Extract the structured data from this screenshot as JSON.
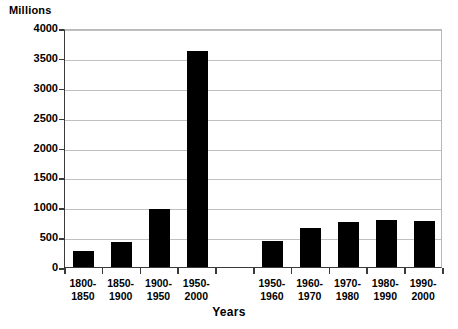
{
  "chart_data": {
    "type": "bar",
    "title": "",
    "ylabel": "Millions",
    "xlabel": "Years",
    "ylim": [
      0,
      4000
    ],
    "ytick_values": [
      0,
      500,
      1000,
      1500,
      2000,
      2500,
      3000,
      3500,
      4000
    ],
    "ytick_labels": [
      "0",
      "500",
      "1000",
      "1500",
      "2000",
      "2500",
      "3000",
      "3500",
      "4000"
    ],
    "grid": true,
    "legend": "none",
    "bar_color": "#000000",
    "categories": [
      "1800-\n1850",
      "1850-\n1900",
      "1900-\n1950",
      "1950-\n2000",
      "",
      "1950-\n1960",
      "1960-\n1970",
      "1970-\n1980",
      "1980-\n1990",
      "1990-\n2000"
    ],
    "category_lines": [
      [
        "1800-",
        "1850"
      ],
      [
        "1850-",
        "1900"
      ],
      [
        "1900-",
        "1950"
      ],
      [
        "1950-",
        "2000"
      ],
      [
        "",
        ""
      ],
      [
        "1950-",
        "1960"
      ],
      [
        "1960-",
        "1970"
      ],
      [
        "1970-",
        "1980"
      ],
      [
        "1980-",
        "1990"
      ],
      [
        "1990-",
        "2000"
      ]
    ],
    "values": [
      275,
      420,
      965,
      3620,
      null,
      440,
      650,
      755,
      790,
      775
    ]
  },
  "axes": {
    "y_title": "Millions",
    "x_title": "Years"
  }
}
